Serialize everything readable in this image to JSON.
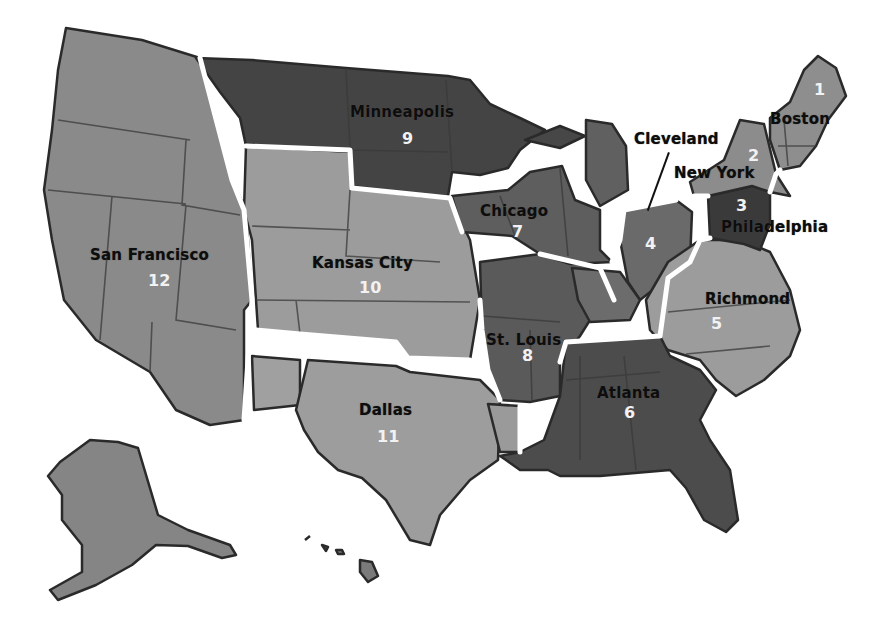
{
  "map": {
    "subject": "Federal Reserve Districts",
    "colors": {
      "light": "#9a9a9a",
      "medium": "#7a7a7a",
      "dark": "#555555",
      "darkest": "#3e3e3e",
      "border": "#ffffff",
      "background": "#ffffff"
    },
    "districts": [
      {
        "number": "1",
        "city": "Boston"
      },
      {
        "number": "2",
        "city": "New York"
      },
      {
        "number": "3",
        "city": "Philadelphia"
      },
      {
        "number": "4",
        "city": "Cleveland"
      },
      {
        "number": "5",
        "city": "Richmond"
      },
      {
        "number": "6",
        "city": "Atlanta"
      },
      {
        "number": "7",
        "city": "Chicago"
      },
      {
        "number": "8",
        "city": "St. Louis"
      },
      {
        "number": "9",
        "city": "Minneapolis"
      },
      {
        "number": "10",
        "city": "Kansas City"
      },
      {
        "number": "11",
        "city": "Dallas"
      },
      {
        "number": "12",
        "city": "San Francisco"
      }
    ]
  }
}
